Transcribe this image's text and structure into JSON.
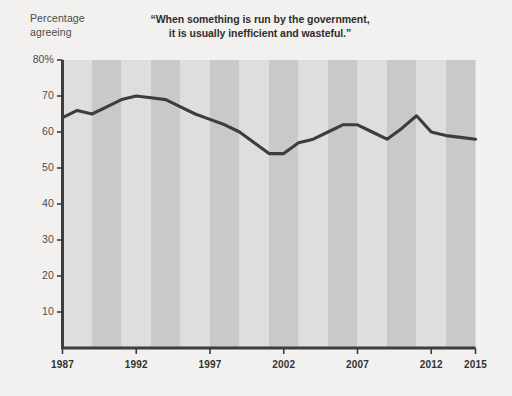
{
  "chart_data": {
    "type": "line",
    "title": "“When something is run by the government,\nit is usually inefficient and wasteful.”",
    "title_line1": "“When something is run by the government,",
    "title_line2": "it is usually inefficient and wasteful.”",
    "ylabel_line1": "Percentage",
    "ylabel_line2": "agreeing",
    "xlabel": "",
    "ylim": [
      0,
      80
    ],
    "xlim": [
      1987,
      2015
    ],
    "grid": false,
    "legend": "none",
    "y_ticks": [
      "80%",
      "70",
      "60",
      "50",
      "40",
      "30",
      "20",
      "10"
    ],
    "y_tick_values": [
      80,
      70,
      60,
      50,
      40,
      30,
      20,
      10
    ],
    "x_ticks": [
      "1987",
      "1992",
      "1997",
      "2002",
      "2007",
      "2012",
      "2015"
    ],
    "x_tick_values": [
      1987,
      1992,
      1997,
      2002,
      2007,
      2012,
      2015
    ],
    "x": [
      1987,
      1988,
      1989,
      1990,
      1991,
      1992,
      1993,
      1994,
      1995,
      1996,
      1997,
      1998,
      1999,
      2000,
      2001,
      2002,
      2003,
      2004,
      2005,
      2006,
      2007,
      2008,
      2009,
      2010,
      2011,
      2012,
      2013,
      2014,
      2015
    ],
    "values": [
      64,
      66,
      65,
      67,
      69,
      70,
      69.5,
      69,
      67,
      65,
      63.5,
      62,
      60,
      57,
      54,
      54,
      57,
      58,
      60,
      62,
      62,
      60,
      58,
      61,
      64.5,
      60,
      59,
      58.5,
      58
    ],
    "series": [
      {
        "name": "Percentage agreeing",
        "values": [
          64,
          66,
          65,
          67,
          69,
          70,
          69.5,
          69,
          67,
          65,
          63.5,
          62,
          60,
          57,
          54,
          54,
          57,
          58,
          60,
          62,
          62,
          60,
          58,
          61,
          64.5,
          60,
          59,
          58.5,
          58
        ]
      }
    ],
    "band_boundaries": [
      1987,
      1989,
      1991,
      1993,
      1995,
      1997,
      1999,
      2001,
      2003,
      2005,
      2007,
      2009,
      2011,
      2013,
      2015
    ],
    "colors": {
      "page_background": "#f2f1ef",
      "plot_band_light": "#dedede",
      "plot_band_dark": "#c9c9c9",
      "line": "#3d3d3d",
      "axis": "#3d3d3d",
      "tick_label": "#4c4c4c",
      "title_text": "#2e2e2e"
    }
  }
}
